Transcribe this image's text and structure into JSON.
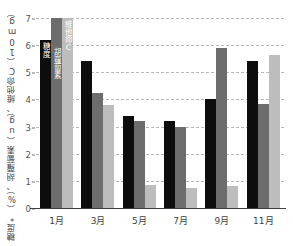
{
  "chart_data": {
    "type": "bar",
    "title": "",
    "subtitle": "",
    "xlabel": "",
    "ylabel": "糖度*（%）、胡蘿蔔素（ug）、維他命C（10mg）",
    "ylim": [
      0,
      7
    ],
    "ytick_step": 1,
    "ytick_labels": [
      "7",
      "6",
      "5",
      "4",
      "3",
      "2",
      "1",
      "0"
    ],
    "ytick_values": [
      7,
      6,
      5,
      4,
      3,
      2,
      1,
      0
    ],
    "grid": true,
    "grid_style": "dashed-horizontal",
    "legend_position": "in-bar-labels-first-group",
    "categories": [
      "1月",
      "3月",
      "5月",
      "7月",
      "9月",
      "11月"
    ],
    "series": [
      {
        "name": "糖度",
        "color": "#0d0d0d",
        "values": [
          6.2,
          5.4,
          3.4,
          3.2,
          4.0,
          5.4
        ]
      },
      {
        "name": "胡蘿蔔素",
        "color": "#6d6d6d",
        "values": [
          7.0,
          4.25,
          3.2,
          3.0,
          5.9,
          3.85
        ]
      },
      {
        "name": "維他命C",
        "color": "#bdbdbd",
        "values": [
          7.0,
          3.8,
          0.85,
          0.75,
          0.8,
          5.65
        ]
      }
    ],
    "annotations": [
      {
        "text": "糖度",
        "series": "糖度",
        "category": "1月",
        "placement": "inside-top"
      },
      {
        "text": "胡蘿蔔素",
        "series": "胡蘿蔔素",
        "category": "1月",
        "placement": "inside"
      },
      {
        "text": "維他命C",
        "series": "維他命C",
        "category": "1月",
        "placement": "inside-top"
      }
    ]
  }
}
